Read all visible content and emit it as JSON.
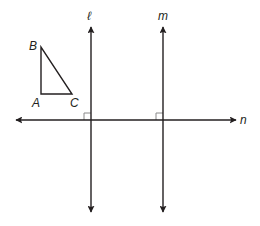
{
  "diagram": {
    "colors": {
      "stroke": "#231f20",
      "right_angle_mark": "#8a8a8a",
      "background": "#ffffff"
    },
    "triangle": {
      "vertices": {
        "A": {
          "label": "A",
          "x": 41,
          "y": 94
        },
        "B": {
          "label": "B",
          "x": 41,
          "y": 47
        },
        "C": {
          "label": "C",
          "x": 72,
          "y": 94
        }
      },
      "right_angle_at": "A"
    },
    "lines": {
      "l": {
        "label": "ℓ",
        "orientation": "vertical",
        "x": 91,
        "y1": 26,
        "y2": 213,
        "arrows": "both"
      },
      "m": {
        "label": "m",
        "orientation": "vertical",
        "x": 163,
        "y1": 26,
        "y2": 213,
        "arrows": "both"
      },
      "n": {
        "label": "n",
        "orientation": "horizontal",
        "y": 120,
        "x1": 15,
        "x2": 237,
        "arrows": "both"
      }
    },
    "right_angle_marks": [
      {
        "at": "l ∩ n",
        "x": 91,
        "y": 120,
        "size": 7
      },
      {
        "at": "m ∩ n",
        "x": 163,
        "y": 120,
        "size": 7
      }
    ]
  }
}
